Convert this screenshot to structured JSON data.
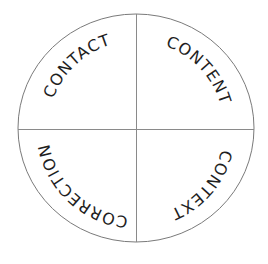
{
  "diagram": {
    "type": "quadrant-circle",
    "quadrants": [
      {
        "position": "top-left",
        "label": "CONTACT"
      },
      {
        "position": "top-right",
        "label": "CONTENT"
      },
      {
        "position": "bottom-right",
        "label": "CONTEXT"
      },
      {
        "position": "bottom-left",
        "label": "CORRECTION"
      }
    ],
    "colors": {
      "ring": "#7a7a7a",
      "divider": "#8a8a8a",
      "text": "#1e1e1e",
      "background": "#ffffff"
    }
  }
}
